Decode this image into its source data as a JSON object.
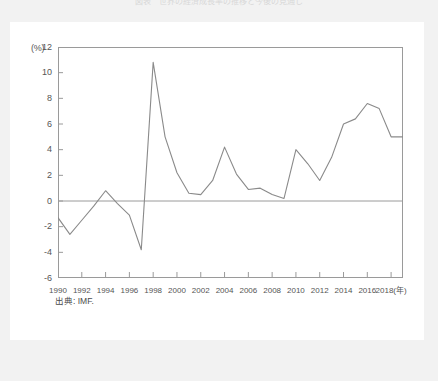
{
  "figure": {
    "title": "図表　世界の経済成長率の推移と今後の見通し",
    "source_note": "出典: IMF."
  },
  "chart_data": {
    "type": "line",
    "title": "",
    "xlabel": "(年)",
    "ylabel": "(%)",
    "y_unit": "(%)",
    "x_unit": "(年)",
    "ylim": [
      -6,
      12
    ],
    "xlim": [
      1990,
      2019
    ],
    "grid": false,
    "zero_line": true,
    "legend": "none",
    "line_color": "#8a8a8a",
    "y_ticks": [
      12,
      10,
      8,
      6,
      4,
      2,
      0,
      -2,
      -4,
      -6
    ],
    "y_tick_labels": [
      "12",
      "10",
      "8",
      "6",
      "4",
      "2",
      "0",
      "-2",
      "-4",
      "-6"
    ],
    "x_ticks": [
      1990,
      1992,
      1994,
      1996,
      1998,
      2000,
      2002,
      2004,
      2006,
      2008,
      2010,
      2012,
      2014,
      2016,
      2018
    ],
    "x_tick_labels": [
      "1990",
      "1992",
      "1994",
      "1996",
      "1998",
      "2000",
      "2002",
      "2004",
      "2006",
      "2008",
      "2010",
      "2012",
      "2014",
      "2016",
      "2018(年)"
    ],
    "series": [
      {
        "name": "成長率",
        "x": [
          1990,
          1991,
          1992,
          1993,
          1994,
          1995,
          1996,
          1997,
          1998,
          1999,
          2000,
          2001,
          2002,
          2003,
          2004,
          2005,
          2006,
          2007,
          2008,
          2009,
          2010,
          2011,
          2012,
          2013,
          2014,
          2015,
          2016,
          2017,
          2018,
          2019
        ],
        "values": [
          -1.3,
          -2.6,
          -1.5,
          -0.4,
          0.8,
          -0.2,
          -1.1,
          -3.8,
          10.8,
          5.0,
          2.2,
          0.6,
          0.5,
          1.6,
          4.2,
          2.1,
          0.9,
          1.0,
          0.5,
          0.2,
          4.0,
          2.9,
          1.6,
          3.4,
          6.0,
          6.4,
          7.6,
          7.2,
          5.0,
          5.0
        ]
      }
    ]
  }
}
